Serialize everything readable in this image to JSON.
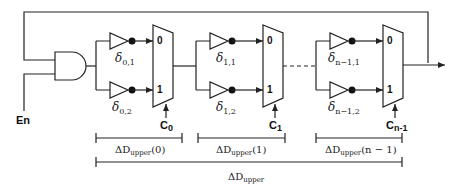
{
  "diagram": {
    "type": "circuit",
    "input_label": "En",
    "stages": [
      {
        "id": 0,
        "buffer_labels": {
          "top": {
            "base": "δ",
            "sub": "0,1"
          },
          "bottom": {
            "base": "δ",
            "sub": "0,2"
          }
        },
        "mux_inputs": [
          "0",
          "1"
        ],
        "control": {
          "base": "C",
          "sub": "0"
        },
        "delay_label": {
          "prefix": "ΔD",
          "sub": "upper",
          "arg": "(0)"
        }
      },
      {
        "id": 1,
        "buffer_labels": {
          "top": {
            "base": "δ",
            "sub": "1,1"
          },
          "bottom": {
            "base": "δ",
            "sub": "1,2"
          }
        },
        "mux_inputs": [
          "0",
          "1"
        ],
        "control": {
          "base": "C",
          "sub": "1"
        },
        "delay_label": {
          "prefix": "ΔD",
          "sub": "upper",
          "arg": "(1)"
        }
      },
      {
        "id": "n-1",
        "buffer_labels": {
          "top": {
            "base": "δ",
            "sub": "n−1,1"
          },
          "bottom": {
            "base": "δ",
            "sub": "n−1,2"
          }
        },
        "mux_inputs": [
          "0",
          "1"
        ],
        "control": {
          "base": "C",
          "sub": "n-1"
        },
        "delay_label": {
          "prefix": "ΔD",
          "sub": "upper",
          "arg": "(n − 1)"
        }
      }
    ],
    "total_delay_label": {
      "prefix": "ΔD",
      "sub": "upper"
    }
  }
}
